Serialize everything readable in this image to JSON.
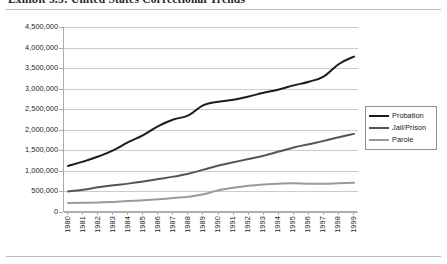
{
  "caption": {
    "text": "Exhibit 5.5:  United States Correctional Trends"
  },
  "colors": {
    "probation": "#1c1c1c",
    "jail_prison": "#555555",
    "parole": "#9a9a9a",
    "gridline": "#c9ccd1",
    "axis": "#a9acb2",
    "background": "#ffffff"
  },
  "legend": {
    "position": "right-inside",
    "items": [
      {
        "label": "Probation",
        "color": "#1c1c1c",
        "icon": "line-swatch-icon"
      },
      {
        "label": "Jail/Prison",
        "color": "#555555",
        "icon": "line-swatch-icon"
      },
      {
        "label": "Parole",
        "color": "#9a9a9a",
        "icon": "line-swatch-icon"
      }
    ]
  },
  "axes": {
    "y_ticks": [
      "4,500,000",
      "4,000,000",
      "3,500,000",
      "3,000,000",
      "2,500,000",
      "2,000,000",
      "1,500,000",
      "1,000,000",
      "500,000",
      "0"
    ],
    "x_ticks": [
      "1980",
      "1981",
      "1982",
      "1983",
      "1984",
      "1985",
      "1986",
      "1987",
      "1988",
      "1989",
      "1990",
      "1991",
      "1992",
      "1993",
      "1994",
      "1995",
      "1996",
      "1997",
      "1998",
      "1999"
    ]
  },
  "chart_data": {
    "type": "line",
    "title": "Exhibit 5.5:  United States Correctional Trends",
    "xlabel": "",
    "ylabel": "",
    "ylim": [
      0,
      4500000
    ],
    "ytick_interval": 500000,
    "grid": true,
    "legend_position": "right-inside",
    "categories": [
      "1980",
      "1981",
      "1982",
      "1983",
      "1984",
      "1985",
      "1986",
      "1987",
      "1988",
      "1989",
      "1990",
      "1991",
      "1992",
      "1993",
      "1994",
      "1995",
      "1996",
      "1997",
      "1998",
      "1999"
    ],
    "series": [
      {
        "name": "Probation",
        "color": "#1c1c1c",
        "values": [
          1120000,
          1225000,
          1350000,
          1500000,
          1700000,
          1870000,
          2090000,
          2250000,
          2350000,
          2600000,
          2680000,
          2730000,
          2810000,
          2900000,
          2980000,
          3080000,
          3170000,
          3300000,
          3600000,
          3780000
        ]
      },
      {
        "name": "Jail/Prison",
        "color": "#555555",
        "values": [
          500000,
          540000,
          600000,
          650000,
          690000,
          740000,
          800000,
          860000,
          930000,
          1030000,
          1130000,
          1210000,
          1290000,
          1370000,
          1470000,
          1570000,
          1650000,
          1730000,
          1820000,
          1900000
        ]
      },
      {
        "name": "Parole",
        "color": "#9a9a9a",
        "values": [
          220000,
          225000,
          230000,
          245000,
          265000,
          285000,
          310000,
          340000,
          370000,
          430000,
          530000,
          590000,
          640000,
          670000,
          690000,
          700000,
          690000,
          690000,
          700000,
          710000
        ]
      }
    ]
  }
}
